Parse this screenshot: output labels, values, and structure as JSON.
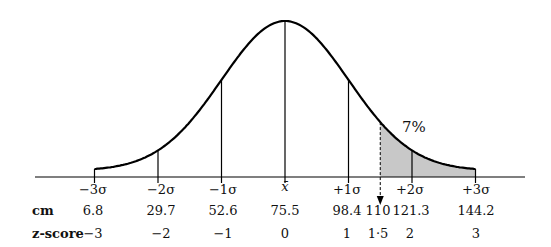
{
  "chart_data": {
    "type": "area",
    "title": "",
    "mean": 75.5,
    "sd": 22.9,
    "sigma_labels": [
      "−3σ",
      "−2σ",
      "−1σ",
      "x̄",
      "+1σ",
      "+2σ",
      "+3σ"
    ],
    "cm_values": [
      "6.8",
      "29.7",
      "52.6",
      "75.5",
      "98.4",
      "110",
      "121.3",
      "144.2"
    ],
    "z_scores": [
      "−3",
      "−2",
      "−1",
      "0",
      "1",
      "1·5",
      "2",
      "3"
    ],
    "row_labels": {
      "cm": "cm",
      "z": "z-score"
    },
    "shaded_region": {
      "from_cm": 110,
      "from_z": 1.5,
      "label": "7%"
    },
    "marker": {
      "cm": 110,
      "z": 1.5,
      "style": "dashed-arrow"
    },
    "shade_color": "#c8c8c8",
    "line_color": "#000000"
  }
}
